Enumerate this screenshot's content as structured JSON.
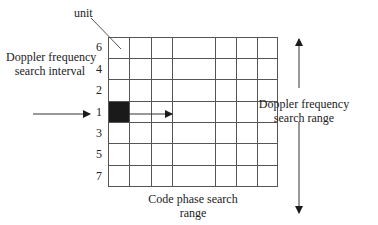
{
  "diagram": {
    "labels": {
      "unit": "unit",
      "left_interval_line1": "Doppler frequency",
      "left_interval_line2": "search interval",
      "right_range_line1": "Doppler frequency",
      "right_range_line2": "search range",
      "bottom_range_line1": "Code phase search",
      "bottom_range_line2": "range"
    },
    "row_labels": [
      "6",
      "4",
      "2",
      "1",
      "3",
      "5",
      "7"
    ],
    "grid": {
      "rows": 7,
      "columns": 7,
      "filled_cell": {
        "row": 4,
        "column": 1
      },
      "line_color": "#555555",
      "fill_color": "#1a1a1a"
    }
  }
}
